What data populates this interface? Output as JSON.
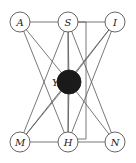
{
  "diagram": {
    "type": "graph",
    "nodes": [
      {
        "id": "A",
        "label": "A",
        "x": 20,
        "y": 22,
        "r": 10,
        "filled": false
      },
      {
        "id": "S",
        "label": "S",
        "x": 68,
        "y": 22,
        "r": 10,
        "filled": false
      },
      {
        "id": "I",
        "label": "I",
        "x": 115,
        "y": 22,
        "r": 10,
        "filled": false
      },
      {
        "id": "Y",
        "label": "Y",
        "x": 69,
        "y": 82,
        "r": 12,
        "filled": true
      },
      {
        "id": "M",
        "label": "M",
        "x": 20,
        "y": 142,
        "r": 10,
        "filled": false
      },
      {
        "id": "H",
        "label": "H",
        "x": 68,
        "y": 142,
        "r": 10,
        "filled": false
      },
      {
        "id": "N",
        "label": "N",
        "x": 115,
        "y": 142,
        "r": 10,
        "filled": false
      }
    ],
    "edges": [
      [
        "A",
        "S"
      ],
      [
        "S",
        "I"
      ],
      [
        "M",
        "H"
      ],
      [
        "H",
        "N"
      ],
      [
        "A",
        "Y"
      ],
      [
        "A",
        "H"
      ],
      [
        "S",
        "Y"
      ],
      [
        "S",
        "M"
      ],
      [
        "S",
        "H"
      ],
      [
        "S",
        "N"
      ],
      [
        "I",
        "Y"
      ],
      [
        "I",
        "M"
      ],
      [
        "I",
        "H"
      ],
      [
        "Y",
        "M"
      ],
      [
        "Y",
        "H"
      ],
      [
        "Y",
        "N"
      ]
    ],
    "bracket": {
      "from": "S",
      "to": "H",
      "x": 86,
      "y1": 22,
      "y2": 139
    },
    "y_label_offset": {
      "dx": -17,
      "dy": 4
    }
  }
}
